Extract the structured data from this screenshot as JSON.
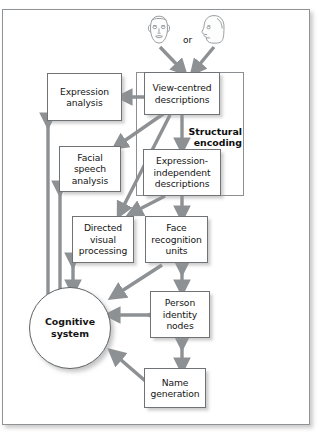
{
  "figure": {
    "type": "flow-diagram",
    "title": "",
    "frame_border_color": "#8f9396",
    "arrow_color": "#8d9194",
    "box_border_color": "#6f7376",
    "background": "#ffffff"
  },
  "inputs": {
    "face_front": "front-view face",
    "face_profile": "profile-view face",
    "or_label": "or"
  },
  "group": {
    "structural_encoding_label_line1": "Structural",
    "structural_encoding_label_line2": "encoding"
  },
  "nodes": [
    {
      "id": "expression-analysis",
      "lines": [
        "Expression",
        "analysis"
      ]
    },
    {
      "id": "view-centred-descriptions",
      "lines": [
        "View-centred",
        "descriptions"
      ]
    },
    {
      "id": "facial-speech-analysis",
      "lines": [
        "Facial",
        "speech",
        "analysis"
      ]
    },
    {
      "id": "expression-independent-descriptions",
      "lines": [
        "Expression-",
        "independent",
        "descriptions"
      ]
    },
    {
      "id": "directed-visual-processing",
      "lines": [
        "Directed",
        "visual",
        "processing"
      ]
    },
    {
      "id": "face-recognition-units",
      "lines": [
        "Face",
        "recognition",
        "units"
      ]
    },
    {
      "id": "person-identity-nodes",
      "lines": [
        "Person",
        "identity",
        "nodes"
      ]
    },
    {
      "id": "name-generation",
      "lines": [
        "Name",
        "generation"
      ]
    },
    {
      "id": "cognitive-system",
      "lines": [
        "Cognitive",
        "system"
      ]
    }
  ],
  "edges": [
    {
      "from": "face-front",
      "to": "view-centred-descriptions",
      "style": "single"
    },
    {
      "from": "face-profile",
      "to": "view-centred-descriptions",
      "style": "single"
    },
    {
      "from": "view-centred-descriptions",
      "to": "expression-analysis",
      "style": "single"
    },
    {
      "from": "view-centred-descriptions",
      "to": "facial-speech-analysis",
      "style": "single"
    },
    {
      "from": "view-centred-descriptions",
      "to": "directed-visual-processing",
      "style": "single"
    },
    {
      "from": "view-centred-descriptions",
      "to": "expression-independent-descriptions",
      "style": "single"
    },
    {
      "from": "expression-independent-descriptions",
      "to": "directed-visual-processing",
      "style": "single"
    },
    {
      "from": "expression-independent-descriptions",
      "to": "face-recognition-units",
      "style": "single"
    },
    {
      "from": "face-recognition-units",
      "to": "cognitive-system",
      "style": "single"
    },
    {
      "from": "face-recognition-units",
      "to": "person-identity-nodes",
      "style": "double"
    },
    {
      "from": "person-identity-nodes",
      "to": "cognitive-system",
      "style": "double"
    },
    {
      "from": "person-identity-nodes",
      "to": "name-generation",
      "style": "double"
    },
    {
      "from": "name-generation",
      "to": "cognitive-system",
      "style": "single"
    },
    {
      "from": "directed-visual-processing",
      "to": "cognitive-system",
      "style": "double"
    },
    {
      "from": "facial-speech-analysis",
      "to": "cognitive-system",
      "style": "double"
    },
    {
      "from": "expression-analysis",
      "to": "cognitive-system",
      "style": "double"
    }
  ]
}
